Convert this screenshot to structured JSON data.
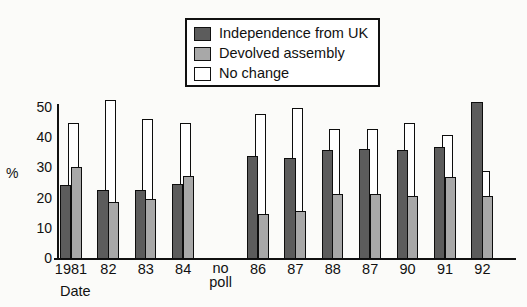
{
  "chart_data": {
    "type": "bar",
    "title": "",
    "subtitle": "",
    "xlabel": "Date",
    "ylabel": "%",
    "ylim": [
      0,
      55
    ],
    "yticks": [
      0,
      10,
      20,
      30,
      40,
      50
    ],
    "ytick_labels": [
      "0",
      "10",
      "20",
      "30",
      "40",
      "50"
    ],
    "grid": false,
    "legend_position": "top-center",
    "categories": [
      "1981",
      "82",
      "83",
      "84",
      "no poll",
      "86",
      "87",
      "88",
      "87",
      "90",
      "91",
      "92"
    ],
    "series": [
      {
        "name": "Independence from UK",
        "color": "#5c5c5c",
        "values": [
          24.5,
          23,
          23,
          25,
          null,
          34,
          33.5,
          36,
          36.5,
          36,
          37,
          52
        ]
      },
      {
        "name": "Devolved assembly",
        "color": "#a8a8a8",
        "values": [
          30.5,
          19,
          20,
          27.5,
          null,
          15,
          16,
          21.5,
          21.5,
          21,
          27,
          21
        ]
      },
      {
        "name": "No change",
        "color": "#ffffff",
        "values": [
          45,
          52.5,
          46.5,
          45,
          null,
          48,
          50,
          43,
          43,
          45,
          41,
          29
        ]
      }
    ],
    "note": "Scottish constitutional preference polls; 1985 shows no poll"
  },
  "legend": {
    "items": [
      {
        "label": "Independence from UK",
        "swatch": "#5c5c5c"
      },
      {
        "label": "Devolved assembly",
        "swatch": "#a8a8a8"
      },
      {
        "label": "No change",
        "swatch": "#ffffff"
      }
    ]
  },
  "axes": {
    "y_title": "%",
    "x_title": "Date",
    "y_ticks": [
      "0",
      "10",
      "20",
      "30",
      "40",
      "50"
    ],
    "x_ticks": [
      "1981",
      "82",
      "83",
      "84",
      "no poll",
      "86",
      "87",
      "88",
      "87",
      "90",
      "91",
      "92"
    ]
  }
}
